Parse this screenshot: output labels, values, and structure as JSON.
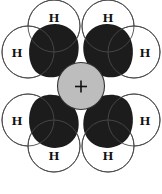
{
  "diagram": {
    "background_color": "#ffffff"
  },
  "nucleus": {
    "name": "central-nucleus",
    "charge_symbol": "+",
    "fill_color": "#bdbdbd",
    "stroke_color": "#333333",
    "cx": 81,
    "cy": 86,
    "r": 23.5
  },
  "orbitals": {
    "fill_color": "#1c1c1c",
    "count": 4,
    "lobes": [
      {
        "name": "lobe-top-left",
        "orientation": "upper-left"
      },
      {
        "name": "lobe-top-right",
        "orientation": "upper-right"
      },
      {
        "name": "lobe-bottom-left",
        "orientation": "lower-left"
      },
      {
        "name": "lobe-bottom-right",
        "orientation": "lower-right"
      }
    ]
  },
  "hydrogens": {
    "symbol": "H",
    "count": 8,
    "circle_fill": "#ffffff",
    "circle_stroke": "#4a4a4a",
    "atoms": [
      {
        "name": "hydrogen-top-left",
        "label": "H",
        "cx": 54,
        "cy": 26,
        "r": 26,
        "label_x": 54,
        "label_y": 17
      },
      {
        "name": "hydrogen-top-right",
        "label": "H",
        "cx": 108,
        "cy": 26,
        "r": 26,
        "label_x": 108,
        "label_y": 17
      },
      {
        "name": "hydrogen-left-upper",
        "label": "H",
        "cx": 28,
        "cy": 52,
        "r": 26,
        "label_x": 17,
        "label_y": 52
      },
      {
        "name": "hydrogen-right-upper",
        "label": "H",
        "cx": 134,
        "cy": 52,
        "r": 26,
        "label_x": 145,
        "label_y": 52
      },
      {
        "name": "hydrogen-left-lower",
        "label": "H",
        "cx": 28,
        "cy": 120,
        "r": 26,
        "label_x": 17,
        "label_y": 120
      },
      {
        "name": "hydrogen-right-lower",
        "label": "H",
        "cx": 134,
        "cy": 120,
        "r": 26,
        "label_x": 145,
        "label_y": 120
      },
      {
        "name": "hydrogen-bottom-left",
        "label": "H",
        "cx": 54,
        "cy": 146,
        "r": 26,
        "label_x": 54,
        "label_y": 155
      },
      {
        "name": "hydrogen-bottom-right",
        "label": "H",
        "cx": 108,
        "cy": 146,
        "r": 26,
        "label_x": 108,
        "label_y": 155
      }
    ]
  }
}
